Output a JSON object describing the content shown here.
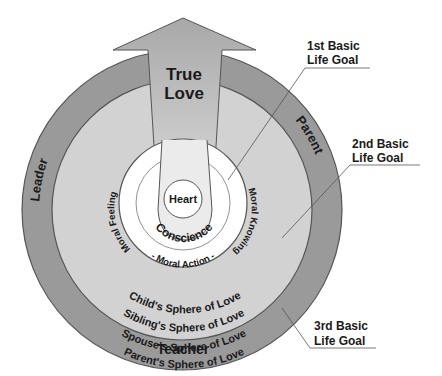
{
  "diagram": {
    "arrow": {
      "line1": "True",
      "line2": "Love"
    },
    "ring_labels": {
      "top_left": "Leader",
      "top_right": "Parent",
      "bottom": "Teacher"
    },
    "core": {
      "heart": "Heart",
      "conscience": "Conscience"
    },
    "moral_ring": {
      "left": "Moral Feeling",
      "bottom": "- Moral Action -",
      "right": "Moral Knowing"
    },
    "spheres": [
      "Child's Sphere of Love",
      "Sibling's Sphere of Love",
      "Spouse's Sphere of Love",
      "Parent's Sphere of Love"
    ],
    "callouts": {
      "goal1": {
        "line1": "1st Basic",
        "line2": "Life Goal"
      },
      "goal2": {
        "line1": "2nd Basic",
        "line2": "Life Goal"
      },
      "goal3": {
        "line1": "3rd Basic",
        "line2": "Life Goal"
      }
    },
    "colors": {
      "outer_ring": "#9a9a9a",
      "middle_disk": "#d2d2d2",
      "arrow": "#bdbdbd",
      "inner_disk": "#ffffff",
      "stroke": "#555555"
    }
  }
}
